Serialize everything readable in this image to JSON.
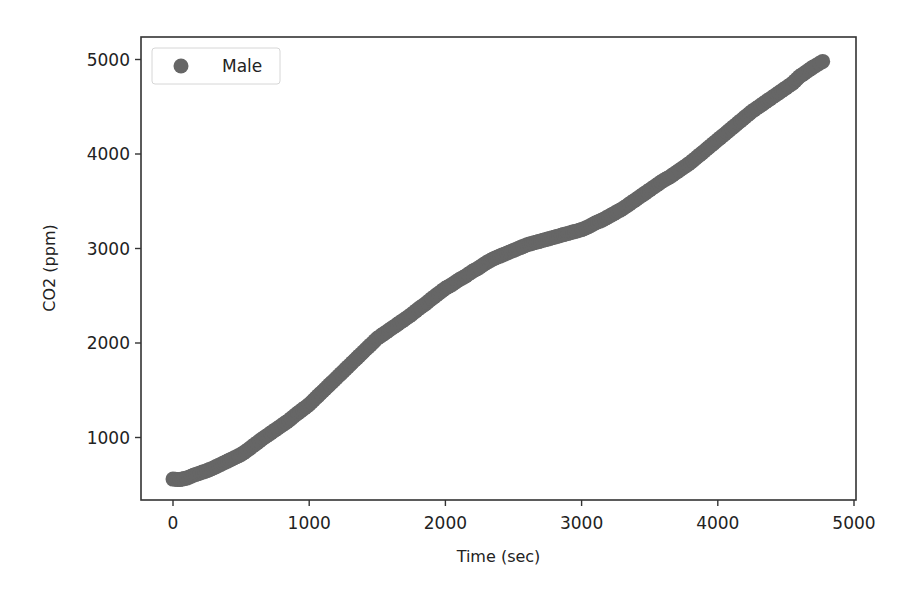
{
  "chart_data": {
    "type": "scatter",
    "title": "",
    "xlabel": "Time (sec)",
    "ylabel": "CO2 (ppm)",
    "xlim": [
      -250,
      5000
    ],
    "ylim": [
      200,
      5200
    ],
    "xticks": [
      0,
      1000,
      2000,
      3000,
      4000,
      5000
    ],
    "yticks": [
      1000,
      2000,
      3000,
      4000,
      5000
    ],
    "grid": false,
    "legend": {
      "position": "upper left",
      "entries": [
        "Male"
      ]
    },
    "series": [
      {
        "name": "Male",
        "color": "#666666",
        "marker": "circle",
        "x": [
          0,
          50,
          100,
          150,
          200,
          250,
          300,
          350,
          400,
          450,
          500,
          550,
          600,
          650,
          700,
          750,
          800,
          850,
          900,
          950,
          1000,
          1050,
          1100,
          1150,
          1200,
          1250,
          1300,
          1350,
          1400,
          1450,
          1500,
          1550,
          1600,
          1650,
          1700,
          1750,
          1800,
          1850,
          1900,
          1950,
          2000,
          2050,
          2100,
          2150,
          2200,
          2250,
          2300,
          2350,
          2400,
          2450,
          2500,
          2550,
          2600,
          2650,
          2700,
          2750,
          2800,
          2850,
          2900,
          2950,
          3000,
          3050,
          3100,
          3150,
          3200,
          3250,
          3300,
          3350,
          3400,
          3450,
          3500,
          3550,
          3600,
          3650,
          3700,
          3750,
          3800,
          3850,
          3900,
          3950,
          4000,
          4050,
          4100,
          4150,
          4200,
          4250,
          4300,
          4350,
          4400,
          4450,
          4500,
          4550,
          4600,
          4650,
          4700,
          4770
        ],
        "y": [
          560,
          555,
          570,
          600,
          625,
          650,
          680,
          715,
          750,
          785,
          820,
          870,
          925,
          980,
          1030,
          1080,
          1130,
          1180,
          1240,
          1295,
          1350,
          1420,
          1490,
          1560,
          1630,
          1700,
          1770,
          1840,
          1910,
          1980,
          2050,
          2100,
          2150,
          2200,
          2250,
          2300,
          2360,
          2410,
          2470,
          2525,
          2580,
          2620,
          2670,
          2710,
          2760,
          2800,
          2850,
          2890,
          2920,
          2950,
          2980,
          3010,
          3040,
          3060,
          3080,
          3100,
          3120,
          3140,
          3160,
          3180,
          3200,
          3230,
          3270,
          3300,
          3340,
          3380,
          3420,
          3470,
          3520,
          3570,
          3620,
          3670,
          3720,
          3760,
          3810,
          3860,
          3910,
          3970,
          4030,
          4090,
          4150,
          4210,
          4270,
          4330,
          4390,
          4450,
          4500,
          4550,
          4600,
          4650,
          4700,
          4750,
          4820,
          4870,
          4920,
          4980
        ]
      }
    ]
  },
  "legend": {
    "label": "Male"
  },
  "axes": {
    "xlabel": "Time (sec)",
    "ylabel": "CO2 (ppm)"
  }
}
